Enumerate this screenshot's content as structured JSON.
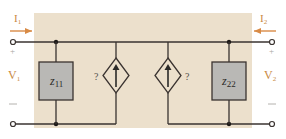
{
  "diagram": {
    "type": "two-port z-parameter equivalent circuit (incomplete)",
    "colors": {
      "background_panel": "#ece0cc",
      "page": "#ffffff",
      "wire": "#3a3330",
      "impedance_box_fill": "#b9b8b5",
      "impedance_box_stroke": "#3a3330",
      "label_orange": "#c98a43",
      "current_arrow": "#d88a45",
      "text_dark": "#2b2a28",
      "sign_gray": "#a8a6a2"
    },
    "port1": {
      "current_label": "I",
      "current_sub": "1",
      "voltage_label": "V",
      "voltage_sub": "1",
      "plus": "+",
      "minus": "—"
    },
    "port2": {
      "current_label": "I",
      "current_sub": "2",
      "voltage_label": "V",
      "voltage_sub": "2",
      "plus": "+",
      "minus": "—"
    },
    "z11": {
      "label": "z",
      "sub": "11"
    },
    "z22": {
      "label": "z",
      "sub": "22"
    },
    "source_left": {
      "label": "?",
      "type": "dependent current source",
      "direction": "up"
    },
    "source_right": {
      "label": "?",
      "type": "dependent current source",
      "direction": "up"
    }
  }
}
